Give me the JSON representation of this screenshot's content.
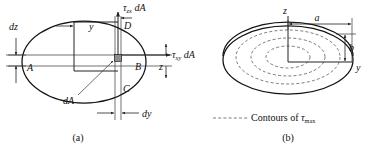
{
  "figure": {
    "panels": [
      {
        "id": "a",
        "caption": "(a)",
        "labels": {
          "dz": "dz",
          "dy": "dy",
          "y_axis": "y",
          "z_axis": "z",
          "point_a": "A",
          "point_b": "B",
          "point_c": "C",
          "point_d": "D",
          "element_area": "dA",
          "force_vertical_tau": "τ",
          "force_vertical_sub": "zx",
          "force_vertical_area": "dA",
          "force_horizontal_tau": "τ",
          "force_horizontal_sub": "xy",
          "force_horizontal_area": "dA"
        }
      },
      {
        "id": "b",
        "caption": "(b)",
        "labels": {
          "semi_major": "a",
          "semi_minor": "b",
          "z_axis": "z",
          "y_axis": "y",
          "contours_text": "Contours of",
          "contours_tau": "τ",
          "contours_sub": "max"
        }
      }
    ],
    "colors": {
      "outline": "#111111",
      "thin_line": "#333333",
      "dashed_contour": "#444444",
      "element_fill": "#8d8d8d",
      "background": "#ffffff"
    }
  }
}
